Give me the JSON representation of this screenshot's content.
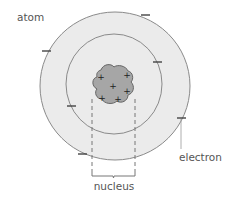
{
  "diagram": {
    "title": "atom",
    "labels": {
      "atom": "atom",
      "electron": "electron",
      "nucleus": "nucleus"
    },
    "nucleus_charges": [
      "+",
      "+",
      "+",
      "+",
      "+",
      "+"
    ],
    "electron_symbols": [
      "−",
      "−",
      "−",
      "−",
      "−",
      "−"
    ],
    "shells": 2,
    "colors": {
      "outer_fill": "#ebebeb",
      "inner_fill": "#ebebeb",
      "shell_stroke": "#8a8a8a",
      "nucleus_fill": "#a6a6a6",
      "nucleus_stroke": "#666666",
      "dashed_line": "#777777",
      "text": "#555555"
    }
  }
}
